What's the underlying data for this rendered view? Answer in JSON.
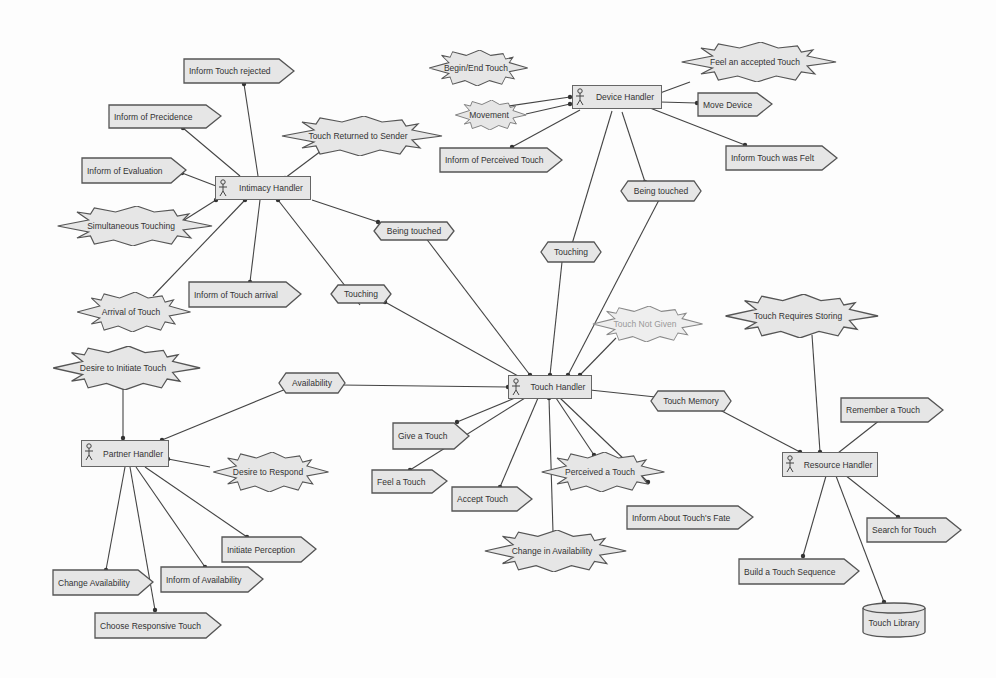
{
  "diagram": {
    "handlers": {
      "intimacy": "Intimacy Handler",
      "device": "Device Handler",
      "touch": "Touch Handler",
      "partner": "Partner Handler",
      "resource": "Resource Handler"
    },
    "actions": {
      "inform_touch_rejected": "Inform Touch rejected",
      "inform_precedence": "Inform of Precidence",
      "inform_evaluation": "Inform of Evaluation",
      "inform_touch_arrival": "Inform of Touch arrival",
      "inform_perceived_touch": "Inform of Perceived Touch",
      "move_device": "Move Device",
      "inform_touch_was_felt": "Inform Touch was Felt",
      "give_touch": "Give a Touch",
      "feel_touch": "Feel a Touch",
      "accept_touch": "Accept Touch",
      "inform_touch_fate": "Inform About Touch's Fate",
      "remember_touch": "Remember a Touch",
      "search_touch": "Search for Touch",
      "build_sequence": "Build a Touch Sequence",
      "change_availability": "Change Availability",
      "choose_response": "Choose Responsive Touch",
      "inform_availability": "Inform of Availability",
      "initiate_perception": "Initiate Perception"
    },
    "events": {
      "touch_returned": "Touch Returned to Sender",
      "simultaneous": "Simultaneous Touching",
      "arrival": "Arrival of Touch",
      "begin_end": "Begin/End Touch",
      "movement": "Movement",
      "feel_accepted": "Feel an accepted Touch",
      "not_given": "Touch Not Given",
      "requires_storing": "Touch Requires Storing",
      "desire_initiate": "Desire to Initiate Touch",
      "desire_respond": "Desire to Respond",
      "perceived": "Perceived a Touch",
      "change_avail": "Change in Availability"
    },
    "channels": {
      "being_touched_1": "Being touched",
      "touching_1": "Touching",
      "touching_2": "Touching",
      "being_touched_2": "Being touched",
      "availability": "Availability",
      "touch_memory": "Touch Memory"
    },
    "stores": {
      "touch_library": "Touch Library"
    },
    "colors": {
      "fill": "#e6e6e6",
      "stroke": "#555555",
      "background": "#fdfdfd"
    }
  }
}
